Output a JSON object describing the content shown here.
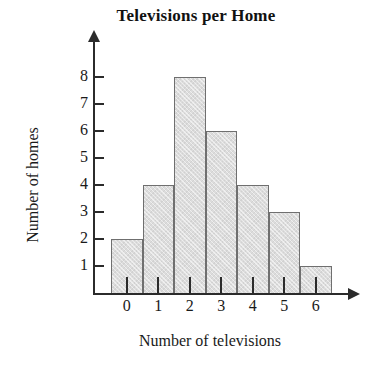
{
  "chart_data": {
    "type": "bar",
    "title": "Televisions per Home",
    "xlabel": "Number of televisions",
    "ylabel": "Number of homes",
    "categories": [
      "0",
      "1",
      "2",
      "3",
      "4",
      "5",
      "6"
    ],
    "values": [
      2,
      4,
      8,
      6,
      4,
      3,
      1
    ],
    "ytick_labels": [
      "1",
      "2",
      "3",
      "4",
      "5",
      "6",
      "7",
      "8"
    ],
    "ylim": [
      0,
      8
    ],
    "grid": false,
    "legend": "none",
    "bar_fill_color": "#dcdcdc",
    "bar_border_color": "#6f6f6f",
    "axis_color": "#2b2b2b",
    "background_color": "#ffffff"
  }
}
